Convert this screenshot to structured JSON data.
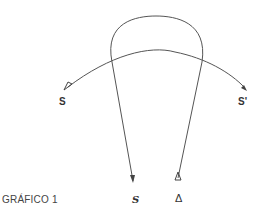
{
  "diagram": {
    "caption": "GRÁFICO 1",
    "labels": {
      "left_origin": "S",
      "right_end": "S'",
      "bottom_left": "S",
      "bottom_right": "Δ"
    },
    "colors": {
      "stroke": "#555555",
      "text": "#333333",
      "background": "#ffffff"
    }
  }
}
